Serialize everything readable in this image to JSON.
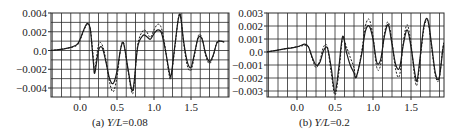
{
  "chart_data": [
    {
      "type": "line",
      "caption_prefix": "(a)",
      "caption_var": "Y/L",
      "caption_value": "=0.08",
      "xlabel": "",
      "ylabel": "",
      "xlim": [
        -0.4,
        1.95
      ],
      "ylim": [
        -0.0048,
        0.004
      ],
      "xticks": [
        "0.0",
        "0.5",
        "1.0",
        "1.5"
      ],
      "xtick_values": [
        0.0,
        0.5,
        1.0,
        1.5
      ],
      "yticks": [
        "0.004",
        "0.002",
        "0.0",
        "−0.002",
        "−0.004"
      ],
      "ytick_values": [
        0.004,
        0.002,
        0.0,
        -0.002,
        -0.004
      ],
      "grid": true,
      "series": [
        {
          "name": "solid",
          "style": "solid",
          "x": [
            -0.4,
            -0.2,
            -0.05,
            0.0,
            0.05,
            0.1,
            0.14,
            0.18,
            0.2,
            0.25,
            0.3,
            0.35,
            0.4,
            0.45,
            0.5,
            0.55,
            0.59,
            0.65,
            0.7,
            0.73,
            0.78,
            0.85,
            0.9,
            0.95,
            1.0,
            1.05,
            1.1,
            1.15,
            1.2,
            1.23,
            1.28,
            1.33,
            1.36,
            1.4,
            1.45,
            1.5,
            1.55,
            1.6,
            1.65,
            1.7,
            1.75,
            1.8,
            1.85,
            1.9,
            1.95
          ],
          "y": [
            0.0,
            0.0002,
            0.0006,
            0.0012,
            0.0022,
            0.0029,
            0.0022,
            -0.0012,
            -0.0024,
            0.0,
            0.0003,
            -0.0012,
            -0.003,
            -0.0035,
            -0.0022,
            0.0002,
            0.0007,
            -0.002,
            -0.0042,
            -0.0035,
            0.0004,
            0.0016,
            0.0015,
            0.0012,
            0.0018,
            0.0022,
            0.0019,
            0.0002,
            -0.002,
            -0.0027,
            0.0004,
            0.0034,
            0.0036,
            0.001,
            -0.0012,
            -0.0018,
            -0.0002,
            0.0014,
            0.0012,
            -0.0004,
            -0.0012,
            -0.0005,
            0.0008,
            0.001,
            0.0009
          ]
        },
        {
          "name": "dashed",
          "style": "dashed",
          "x": [
            -0.4,
            -0.2,
            -0.05,
            0.0,
            0.05,
            0.1,
            0.14,
            0.18,
            0.2,
            0.25,
            0.3,
            0.35,
            0.4,
            0.45,
            0.5,
            0.55,
            0.59,
            0.65,
            0.7,
            0.73,
            0.78,
            0.85,
            0.9,
            0.95,
            1.0,
            1.05,
            1.1,
            1.15,
            1.2,
            1.23,
            1.28,
            1.33,
            1.36,
            1.4,
            1.45,
            1.5,
            1.55,
            1.6,
            1.65,
            1.7,
            1.75,
            1.8,
            1.85,
            1.9,
            1.95
          ],
          "y": [
            0.0,
            0.0002,
            0.0005,
            0.0011,
            0.0021,
            0.0028,
            0.0023,
            -0.0008,
            -0.002,
            0.0006,
            0.0006,
            -0.001,
            -0.0034,
            -0.0044,
            -0.0028,
            0.0002,
            0.0008,
            -0.0022,
            -0.0045,
            -0.0038,
            0.0006,
            0.0021,
            0.002,
            0.0014,
            0.0022,
            0.0028,
            0.0024,
            0.0004,
            -0.0024,
            -0.0029,
            0.0002,
            0.0035,
            0.0037,
            0.0008,
            -0.0016,
            -0.0021,
            -0.0004,
            0.0016,
            0.0013,
            -0.0006,
            -0.0014,
            -0.0006,
            0.0009,
            0.001,
            0.0009
          ]
        }
      ]
    },
    {
      "type": "line",
      "caption_prefix": "(b)",
      "caption_var": "Y/L",
      "caption_value": "=0.2",
      "xlabel": "",
      "ylabel": "",
      "xlim": [
        -0.4,
        1.95
      ],
      "ylim": [
        -0.0034,
        0.003
      ],
      "xticks": [
        "0.0",
        "0.5",
        "1.0",
        "1.5"
      ],
      "xtick_values": [
        0.0,
        0.5,
        1.0,
        1.5
      ],
      "yticks": [
        "0.003",
        "0.002",
        "0.001",
        "0.0",
        "−0.001",
        "−0.002",
        "−0.003"
      ],
      "ytick_values": [
        0.003,
        0.002,
        0.001,
        0.0,
        -0.001,
        -0.002,
        -0.003
      ],
      "grid": true,
      "series": [
        {
          "name": "solid",
          "style": "solid",
          "x": [
            -0.4,
            -0.2,
            0.0,
            0.1,
            0.15,
            0.2,
            0.25,
            0.3,
            0.35,
            0.4,
            0.45,
            0.5,
            0.55,
            0.6,
            0.65,
            0.7,
            0.75,
            0.78,
            0.85,
            0.9,
            0.95,
            1.0,
            1.05,
            1.1,
            1.15,
            1.2,
            1.25,
            1.3,
            1.35,
            1.4,
            1.45,
            1.5,
            1.55,
            1.58,
            1.62,
            1.67,
            1.72,
            1.77,
            1.82,
            1.87,
            1.92,
            1.95
          ],
          "y": [
            0.0,
            0.0002,
            0.0004,
            0.0006,
            0.0004,
            -0.0004,
            -0.001,
            -0.0008,
            0.0001,
            0.0003,
            -0.0012,
            -0.0031,
            -0.0012,
            0.0012,
            0.0,
            -0.001,
            -0.0016,
            -0.0019,
            -0.0002,
            0.0016,
            0.002,
            0.001,
            -0.0008,
            -0.0006,
            0.0012,
            0.0021,
            0.0006,
            -0.001,
            -0.0012,
            0.0006,
            0.0017,
            0.0004,
            -0.0016,
            -0.0022,
            -0.0004,
            0.002,
            0.0025,
            0.0006,
            -0.0016,
            -0.002,
            0.0002,
            0.0008
          ]
        },
        {
          "name": "dashed",
          "style": "dashed",
          "x": [
            -0.4,
            -0.2,
            0.0,
            0.1,
            0.15,
            0.2,
            0.25,
            0.3,
            0.35,
            0.4,
            0.45,
            0.5,
            0.55,
            0.6,
            0.65,
            0.7,
            0.75,
            0.78,
            0.85,
            0.9,
            0.95,
            1.0,
            1.05,
            1.1,
            1.15,
            1.2,
            1.25,
            1.3,
            1.35,
            1.4,
            1.45,
            1.5,
            1.55,
            1.58,
            1.62,
            1.67,
            1.72,
            1.77,
            1.82,
            1.87,
            1.92,
            1.95
          ],
          "y": [
            0.0,
            0.0002,
            0.0004,
            0.0005,
            0.0004,
            -0.0005,
            -0.0012,
            -0.0007,
            0.0004,
            0.0004,
            -0.0016,
            -0.0033,
            -0.0016,
            0.001,
            0.0004,
            -0.0004,
            -0.0012,
            -0.002,
            0.0,
            0.002,
            0.0025,
            0.0012,
            -0.0012,
            -0.001,
            0.0014,
            0.0023,
            0.0008,
            -0.0014,
            -0.0018,
            0.0008,
            0.0021,
            0.0006,
            -0.002,
            -0.0025,
            -0.0006,
            0.0018,
            0.0024,
            0.0004,
            -0.0018,
            -0.0021,
            0.0004,
            0.0008
          ]
        }
      ]
    }
  ],
  "colors": {
    "line": "#1a1a1a",
    "grid": "#2a2a2a",
    "background": "#ffffff"
  }
}
